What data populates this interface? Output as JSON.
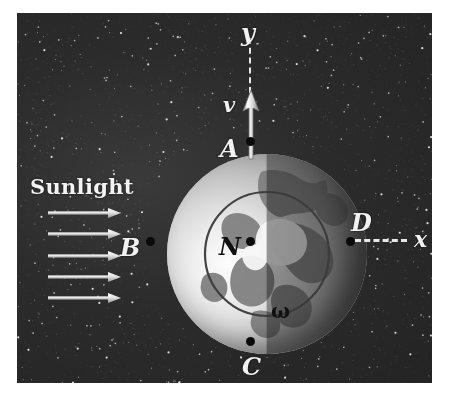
{
  "figure": {
    "background_color": "#242424",
    "frame": {
      "x": 17,
      "y": 13,
      "width": 415,
      "height": 370
    }
  },
  "labels": {
    "sunlight": "Sunlight",
    "axis_y": "y",
    "axis_x": "x",
    "velocity": "v",
    "omega": "ω",
    "point_a": "A",
    "point_b": "B",
    "point_c": "C",
    "point_d": "D",
    "point_n": "N"
  },
  "colors": {
    "space": "#242424",
    "star": "#d8d8d8",
    "line": "#e8e8e8",
    "label_light": "#f2f2f2",
    "label_dark": "#101010",
    "earth_lit": "#f0f0f0",
    "earth_night": "#6e6e6e",
    "continent": "#7a7a7a"
  },
  "geometry": {
    "earth_center": {
      "x": 250,
      "y": 241
    },
    "earth_radius": 100,
    "points": [
      {
        "name": "A",
        "x": 250,
        "y": 141,
        "label_side": "left",
        "label_color": "light"
      },
      {
        "name": "B",
        "x": 150,
        "y": 241,
        "label_side": "left",
        "label_color": "light"
      },
      {
        "name": "C",
        "x": 250,
        "y": 341,
        "label_side": "below",
        "label_color": "light"
      },
      {
        "name": "D",
        "x": 350,
        "y": 241,
        "label_side": "above",
        "label_color": "light"
      },
      {
        "name": "N",
        "x": 250,
        "y": 241,
        "label_side": "left",
        "label_color": "dark"
      }
    ],
    "sunlight_arrows": 5,
    "sunlight_arrow_y": [
      213,
      234,
      256,
      277,
      298
    ],
    "sunlight_arrow_x_start": 48,
    "sunlight_arrow_x_end": 119
  },
  "chart_data": {
    "type": "diagram",
    "annotations": [
      {
        "text": "Sunlight",
        "role": "incident-light-label"
      },
      {
        "text": "y",
        "role": "axis-label-vertical"
      },
      {
        "text": "x",
        "role": "axis-label-horizontal"
      },
      {
        "text": "v",
        "role": "velocity-vector-label"
      },
      {
        "text": "ω",
        "role": "angular-velocity-label"
      },
      {
        "text": "A",
        "role": "point-north-pole-top"
      },
      {
        "text": "B",
        "role": "point-left-limb"
      },
      {
        "text": "C",
        "role": "point-bottom"
      },
      {
        "text": "D",
        "role": "point-right-limb"
      },
      {
        "text": "N",
        "role": "point-center-north-pole"
      }
    ]
  }
}
